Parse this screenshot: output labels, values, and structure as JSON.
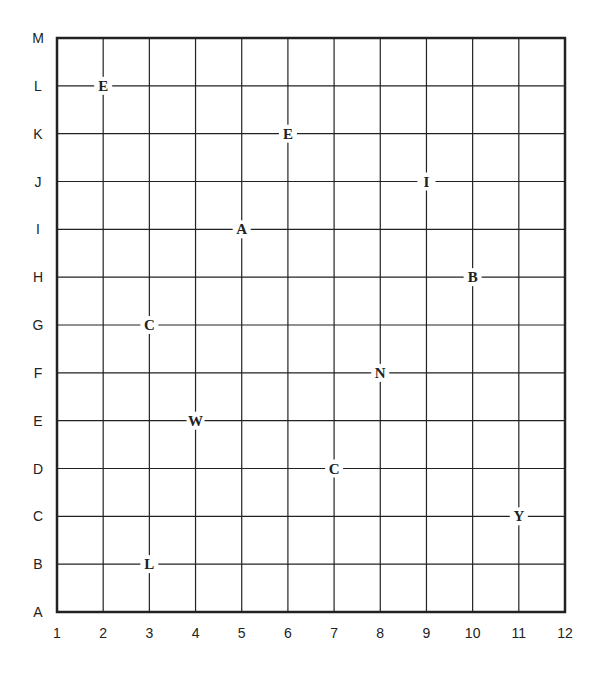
{
  "puzzle": {
    "columns": [
      "1",
      "2",
      "3",
      "4",
      "5",
      "6",
      "7",
      "8",
      "9",
      "10",
      "11",
      "12"
    ],
    "rows": [
      "M",
      "L",
      "K",
      "J",
      "I",
      "H",
      "G",
      "F",
      "E",
      "D",
      "C",
      "B",
      "A"
    ],
    "letters": [
      {
        "char": "E",
        "col": "2",
        "row": "L"
      },
      {
        "char": "E",
        "col": "6",
        "row": "K"
      },
      {
        "char": "I",
        "col": "9",
        "row": "J"
      },
      {
        "char": "A",
        "col": "5",
        "row": "I"
      },
      {
        "char": "B",
        "col": "10",
        "row": "H"
      },
      {
        "char": "C",
        "col": "3",
        "row": "G"
      },
      {
        "char": "N",
        "col": "8",
        "row": "F"
      },
      {
        "char": "W",
        "col": "4",
        "row": "E"
      },
      {
        "char": "C",
        "col": "7",
        "row": "D"
      },
      {
        "char": "Y",
        "col": "11",
        "row": "C"
      },
      {
        "char": "L",
        "col": "3",
        "row": "B"
      }
    ]
  },
  "colors": {
    "line": "#222222",
    "background": "#ffffff"
  }
}
